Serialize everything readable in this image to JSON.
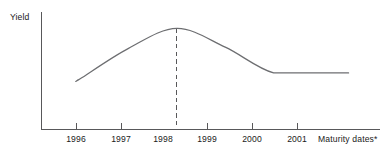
{
  "chart_data": {
    "type": "line",
    "title": "",
    "subtitle": "",
    "ylabel": "Yield",
    "xlabel": "Maturity dates*",
    "grid": false,
    "legend": false,
    "legend_position": "none",
    "axis_ticks_y": [],
    "categories": [
      "1996",
      "1997",
      "1998",
      "1999",
      "2000",
      "2001"
    ],
    "x": [
      1996,
      1997,
      1998,
      1999,
      2000,
      2001
    ],
    "xlim": [
      1995.2,
      2002.2
    ],
    "ylim": [
      0,
      100
    ],
    "annotations": [
      {
        "name": "peak-dashed-guide",
        "type": "vline",
        "x": "1998",
        "style": "dashed",
        "label": ""
      }
    ],
    "series": [
      {
        "name": "Yield curve",
        "color": "#6d6e71",
        "style": "solid",
        "points": [
          {
            "x": "1995.95",
            "y": 42
          },
          {
            "x": "1996",
            "y": 43
          },
          {
            "x": "1997",
            "y": 69
          },
          {
            "x": "1998",
            "y": 86
          },
          {
            "x": "1999",
            "y": 70
          },
          {
            "x": "2000",
            "y": 48
          },
          {
            "x": "2001",
            "y": 48
          },
          {
            "x": "2001.55",
            "y": 48
          }
        ],
        "values": [
          43,
          69,
          86,
          70,
          48,
          48
        ]
      }
    ]
  },
  "axes": {
    "y_axis_title": "Yield",
    "x_axis_caption": "Maturity dates*",
    "x_tick_labels": [
      "1996",
      "1997",
      "1998",
      "1999",
      "2000",
      "2001"
    ]
  },
  "colors": {
    "curve": "#6d6e71",
    "axis": "#58585a",
    "text": "#1a1a1a",
    "background": "#ffffff"
  }
}
